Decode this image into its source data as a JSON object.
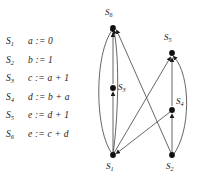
{
  "statements": {
    "rows": [
      {
        "label": "S",
        "index": "1",
        "code": "a := 0"
      },
      {
        "label": "S",
        "index": "2",
        "code": "b := 1"
      },
      {
        "label": "S",
        "index": "3",
        "code": "c := a + 1"
      },
      {
        "label": "S",
        "index": "4",
        "code": "d := b + a"
      },
      {
        "label": "S",
        "index": "5",
        "code": "e := d + 1"
      },
      {
        "label": "S",
        "index": "6",
        "code": "e := c + d"
      }
    ]
  },
  "graph": {
    "node_color": "#111111",
    "edge_color": "#555555",
    "nodes": [
      {
        "id": "S6",
        "label": "S",
        "index": "6",
        "x": 23,
        "y": 28,
        "label_x": 15,
        "label_y": 8
      },
      {
        "id": "S5",
        "label": "S",
        "index": "5",
        "x": 82,
        "y": 53,
        "label_x": 74,
        "label_y": 33
      },
      {
        "id": "S3",
        "label": "S",
        "index": "3",
        "x": 23,
        "y": 88,
        "label_x": 28,
        "label_y": 83
      },
      {
        "id": "S4",
        "label": "S",
        "index": "4",
        "x": 82,
        "y": 110,
        "label_x": 86,
        "label_y": 96
      },
      {
        "id": "S1",
        "label": "S",
        "index": "1",
        "x": 23,
        "y": 155,
        "label_x": 16,
        "label_y": 162
      },
      {
        "id": "S2",
        "label": "S",
        "index": "2",
        "x": 82,
        "y": 155,
        "label_x": 76,
        "label_y": 162
      }
    ],
    "edges": [
      {
        "from": "S1",
        "to": "S3",
        "kind": "straight"
      },
      {
        "from": "S3",
        "to": "S6",
        "kind": "straight"
      },
      {
        "from": "S1",
        "to": "S6",
        "kind": "curve-left"
      },
      {
        "from": "S1",
        "to": "S6",
        "kind": "straight-inner"
      },
      {
        "from": "S1",
        "to": "S5",
        "kind": "cross"
      },
      {
        "from": "S2",
        "to": "S6",
        "kind": "cross"
      },
      {
        "from": "S2",
        "to": "S4",
        "kind": "straight"
      },
      {
        "from": "S4",
        "to": "S5",
        "kind": "straight"
      },
      {
        "from": "S2",
        "to": "S5",
        "kind": "curve-right"
      },
      {
        "from": "S4",
        "to": "S1",
        "kind": "cross-down"
      }
    ]
  }
}
